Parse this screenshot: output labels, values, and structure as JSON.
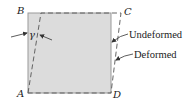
{
  "diagram": {
    "vertices": {
      "A": "A",
      "B": "B",
      "C": "C",
      "D": "D"
    },
    "angle_label": "γ",
    "legend": {
      "undeformed": "Undeformed",
      "deformed": "Deformed"
    },
    "colors": {
      "fill": "#dcdcdc",
      "edge": "#8a8a8a",
      "dashed": "#555555",
      "text": "#222222"
    }
  }
}
